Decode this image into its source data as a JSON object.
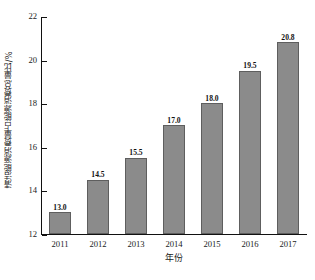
{
  "chart_data": {
    "type": "bar",
    "title": "",
    "subtitle": "",
    "xlabel": "年份",
    "ylabel": "清洁能源消费量占能源消费总量比/%",
    "categories": [
      "2011",
      "2012",
      "2013",
      "2014",
      "2015",
      "2016",
      "2017"
    ],
    "values": [
      13.0,
      14.5,
      15.5,
      17.0,
      18.0,
      19.5,
      20.8
    ],
    "data_labels": [
      "13.0",
      "14.5",
      "15.5",
      "17.0",
      "18.0",
      "19.5",
      "20.8"
    ],
    "series": [
      {
        "name": "清洁能源消费量占能源消费总量比",
        "values": [
          13.0,
          14.5,
          15.5,
          17.0,
          18.0,
          19.5,
          20.8
        ]
      }
    ],
    "ylim": [
      12,
      22
    ],
    "yticks": [
      12,
      14,
      16,
      18,
      20,
      22
    ],
    "ytick_labels": [
      "12",
      "14",
      "16",
      "18",
      "20",
      "22"
    ],
    "xlim_categories": 7,
    "grid": false,
    "legend": false,
    "legend_position": "none",
    "bar_color": "#8b8b8b",
    "bar_edge_color": "#5e5e5e",
    "axis_color": "#111111",
    "background_color": "#ffffff",
    "annotations": []
  }
}
